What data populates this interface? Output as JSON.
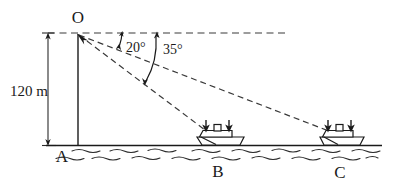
{
  "figure": {
    "type": "geometry-diagram",
    "points": {
      "O": {
        "label": "O",
        "x": 78,
        "y": 33,
        "role": "observation-point-top-of-cliff"
      },
      "A": {
        "label": "A",
        "x": 78,
        "y": 145,
        "role": "base-of-cliff"
      },
      "B": {
        "label": "B",
        "x": 218,
        "y": 145,
        "role": "near-ship"
      },
      "C": {
        "label": "C",
        "x": 340,
        "y": 145,
        "role": "far-ship"
      }
    },
    "point_labels": {
      "O": "O",
      "A": "A",
      "B": "B",
      "C": "C"
    },
    "dimension": {
      "label": "120 m",
      "value": 120,
      "unit": "m",
      "from": "O",
      "to": "A"
    },
    "angles": [
      {
        "label": "20°",
        "value": 20,
        "unit": "degree",
        "from": "horizontal",
        "to": "OC",
        "name": "angle-of-depression-to-C"
      },
      {
        "label": "35°",
        "value": 35,
        "unit": "degree",
        "from": "horizontal",
        "to": "OB",
        "name": "angle-of-depression-to-B"
      }
    ],
    "horizontal_reference": {
      "name": "horizontal-dashed-line",
      "from_x": 48,
      "to_x": 288,
      "y": 33
    },
    "ships": [
      {
        "at": "B",
        "x": 218,
        "arrows": 2
      },
      {
        "at": "C",
        "x": 340,
        "arrows": 2
      }
    ],
    "ground_line": {
      "y": 145,
      "from_x": 46,
      "to_x": 382
    },
    "water": {
      "rows": 2,
      "style": "wavy-dashes"
    },
    "colors": {
      "ink": "#1a1a1a",
      "dash": "#3a3a3a",
      "background": "#ffffff"
    }
  }
}
